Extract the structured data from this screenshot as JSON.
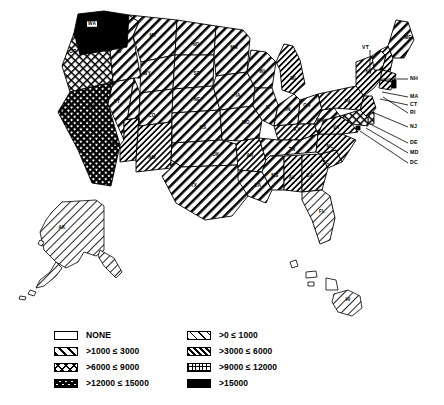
{
  "map": {
    "title": "United States choropleth map",
    "projection_note": "lower 48 with Alaska and Hawaii insets",
    "legend": {
      "items": [
        {
          "label": "NONE",
          "pattern": "none",
          "column": "left",
          "id": "none"
        },
        {
          "label": ">1000 ≤ 3000",
          "pattern": "diag-thick",
          "column": "left",
          "id": "1000-3000"
        },
        {
          "label": ">6000 ≤ 9000",
          "pattern": "crosshatch",
          "column": "left",
          "id": "6000-9000"
        },
        {
          "label": ">12000 ≤ 15000",
          "pattern": "checker",
          "column": "left",
          "id": "12000-15000"
        },
        {
          "label": ">0 ≤ 1000",
          "pattern": "diag-thin",
          "column": "right",
          "id": "0-1000"
        },
        {
          "label": ">3000 ≤ 6000",
          "pattern": "diag-medium",
          "column": "right",
          "id": "3000-6000"
        },
        {
          "label": ">9000 ≤ 12000",
          "pattern": "grid",
          "column": "right",
          "id": "9000-12000"
        },
        {
          "label": ">15000",
          "pattern": "solid-black",
          "column": "right",
          "id": "15000+"
        }
      ]
    },
    "colors": {
      "ink": "#000000",
      "paper": "#ffffff"
    },
    "states": [
      {
        "abbr": "WA",
        "bucket": "15000+",
        "label_x": 92,
        "label_y": 24,
        "plate": true
      },
      {
        "abbr": "OR",
        "bucket": "6000-9000",
        "label_x": 73,
        "label_y": 52
      },
      {
        "abbr": "CA",
        "bucket": "12000-15000",
        "label_x": 63,
        "label_y": 113
      },
      {
        "abbr": "NV",
        "bucket": "1000-3000",
        "label_x": 91,
        "label_y": 107
      },
      {
        "abbr": "ID",
        "bucket": "1000-3000",
        "label_x": 119,
        "label_y": 52
      },
      {
        "abbr": "MT",
        "bucket": "1000-3000",
        "label_x": 153,
        "label_y": 36
      },
      {
        "abbr": "WY",
        "bucket": "1000-3000",
        "label_x": 147,
        "label_y": 74
      },
      {
        "abbr": "UT",
        "bucket": "1000-3000",
        "label_x": 117,
        "label_y": 102
      },
      {
        "abbr": "AZ",
        "bucket": "3000-6000",
        "label_x": 114,
        "label_y": 144
      },
      {
        "abbr": "CO",
        "bucket": "1000-3000",
        "label_x": 152,
        "label_y": 116
      },
      {
        "abbr": "NM",
        "bucket": "3000-6000",
        "label_x": 152,
        "label_y": 158
      },
      {
        "abbr": "ND",
        "bucket": "1000-3000",
        "label_x": 196,
        "label_y": 45
      },
      {
        "abbr": "SD",
        "bucket": "1000-3000",
        "label_x": 197,
        "label_y": 74
      },
      {
        "abbr": "NE",
        "bucket": "1000-3000",
        "label_x": 197,
        "label_y": 100
      },
      {
        "abbr": "KS",
        "bucket": "1000-3000",
        "label_x": 203,
        "label_y": 128
      },
      {
        "abbr": "OK",
        "bucket": "1000-3000",
        "label_x": 216,
        "label_y": 155
      },
      {
        "abbr": "TX",
        "bucket": "1000-3000",
        "label_x": 194,
        "label_y": 186
      },
      {
        "abbr": "MN",
        "bucket": "1000-3000",
        "label_x": 234,
        "label_y": 48
      },
      {
        "abbr": "IA",
        "bucket": "1000-3000",
        "label_x": 238,
        "label_y": 96
      },
      {
        "abbr": "MO",
        "bucket": "1000-3000",
        "label_x": 246,
        "label_y": 123
      },
      {
        "abbr": "AR",
        "bucket": "3000-6000",
        "label_x": 250,
        "label_y": 156
      },
      {
        "abbr": "LA",
        "bucket": "1000-3000",
        "label_x": 258,
        "label_y": 186
      },
      {
        "abbr": "WI",
        "bucket": "1000-3000",
        "label_x": 262,
        "label_y": 72
      },
      {
        "abbr": "IL",
        "bucket": "1000-3000",
        "label_x": 268,
        "label_y": 108
      },
      {
        "abbr": "MI",
        "bucket": "3000-6000",
        "label_x": 293,
        "label_y": 79
      },
      {
        "abbr": "IN",
        "bucket": "1000-3000",
        "label_x": 288,
        "label_y": 110
      },
      {
        "abbr": "OH",
        "bucket": "1000-3000",
        "label_x": 307,
        "label_y": 106
      },
      {
        "abbr": "KY",
        "bucket": "3000-6000",
        "label_x": 297,
        "label_y": 130
      },
      {
        "abbr": "TN",
        "bucket": "1000-3000",
        "label_x": 292,
        "label_y": 150
      },
      {
        "abbr": "MS",
        "bucket": "1000-3000",
        "label_x": 275,
        "label_y": 176
      },
      {
        "abbr": "AL",
        "bucket": "3000-6000",
        "label_x": 292,
        "label_y": 178
      },
      {
        "abbr": "GA",
        "bucket": "3000-6000",
        "label_x": 310,
        "label_y": 176
      },
      {
        "abbr": "FL",
        "bucket": "0-1000",
        "label_x": 322,
        "label_y": 212
      },
      {
        "abbr": "SC",
        "bucket": "3000-6000",
        "label_x": 326,
        "label_y": 163
      },
      {
        "abbr": "NC",
        "bucket": "3000-6000",
        "label_x": 330,
        "label_y": 147
      },
      {
        "abbr": "VA",
        "bucket": "3000-6000",
        "label_x": 336,
        "label_y": 128
      },
      {
        "abbr": "WV",
        "bucket": "1000-3000",
        "label_x": 320,
        "label_y": 121
      },
      {
        "abbr": "PA",
        "bucket": "3000-6000",
        "label_x": 348,
        "label_y": 102
      },
      {
        "abbr": "NY",
        "bucket": "3000-6000",
        "label_x": 369,
        "label_y": 72
      },
      {
        "abbr": "ME",
        "bucket": "1000-3000",
        "label_x": 408,
        "label_y": 38
      },
      {
        "abbr": "AK",
        "bucket": "0-1000",
        "label_x": 62,
        "label_y": 228
      },
      {
        "abbr": "HI",
        "bucket": "0-1000",
        "label_x": 348,
        "label_y": 300
      }
    ],
    "external_labels": [
      {
        "abbr": "VT",
        "text_x": 362,
        "text_y": 48,
        "line": "M 370 50 L 370 74"
      },
      {
        "abbr": "NH",
        "text_x": 410,
        "text_y": 79,
        "line": "M 408 79 L 381 79"
      },
      {
        "abbr": "MA",
        "text_x": 410,
        "text_y": 97,
        "line": "M 408 97 L 382 92"
      },
      {
        "abbr": "CT",
        "text_x": 410,
        "text_y": 105,
        "line": "M 408 105 L 380 99"
      },
      {
        "abbr": "RI",
        "text_x": 410,
        "text_y": 113,
        "line": "M 408 113 L 383 97"
      },
      {
        "abbr": "NJ",
        "text_x": 410,
        "text_y": 127,
        "line": "M 408 127 L 372 112"
      },
      {
        "abbr": "DE",
        "text_x": 410,
        "text_y": 143,
        "line": "M 408 143 L 370 124"
      },
      {
        "abbr": "MD",
        "text_x": 410,
        "text_y": 153,
        "line": "M 408 153 L 366 128"
      },
      {
        "abbr": "DC",
        "text_x": 410,
        "text_y": 163,
        "line": "M 408 163 L 360 131"
      }
    ]
  }
}
